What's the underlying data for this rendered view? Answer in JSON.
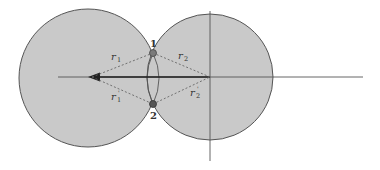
{
  "diagram": {
    "colors": {
      "background": "#ffffff",
      "circle_fill": "#c9c9c9",
      "circle_stroke": "#555555",
      "axis": "#555555",
      "dashed": "#666666",
      "point": "#555555",
      "arrow": "#222222"
    },
    "circles": [
      {
        "name": "left-circle",
        "cx": 88,
        "cy": 78,
        "r": 69
      },
      {
        "name": "right-circle",
        "cx": 210,
        "cy": 77,
        "r": 63
      }
    ],
    "axes": {
      "horizontal": {
        "x1": 58,
        "y1": 77,
        "x2": 363,
        "y2": 77
      },
      "vertical": {
        "x1": 210,
        "y1": 11,
        "x2": 210,
        "y2": 161
      }
    },
    "arrow": {
      "from": [
        210,
        77
      ],
      "to": [
        90,
        77
      ]
    },
    "points": [
      {
        "label": "1",
        "x": 153,
        "y": 53,
        "label_x": 153,
        "label_y": 45
      },
      {
        "label": "2",
        "x": 153,
        "y": 104,
        "label_x": 153,
        "label_y": 118
      }
    ],
    "radius_labels": {
      "r1": {
        "base": "r",
        "sub": "1",
        "prime": false
      },
      "r2": {
        "base": "r",
        "sub": "2",
        "prime": false
      },
      "r1p": {
        "base": "r",
        "sub": "1",
        "prime": true
      },
      "r2p": {
        "base": "r",
        "sub": "2",
        "prime": true
      }
    },
    "prime_mark": "'"
  }
}
